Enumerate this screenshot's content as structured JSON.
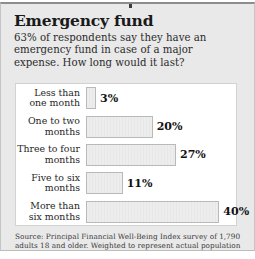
{
  "card": {
    "headline": "Emergency fund",
    "deck": "63% of respondents say they have an emergency fund in case of a major expense. How long would it last?",
    "source": "Source: Principal Financial Well-Being Index survey of 1,790 adults 18 and older. Weighted to represent actual population",
    "accent_color": "#8d8d8d",
    "background_color": "#e9e9e9",
    "panel_color": "#ffffff",
    "bar_fill_color": "#ededed",
    "bar_border_color": "#b9b9b9"
  },
  "chart_data": {
    "type": "bar",
    "orientation": "horizontal",
    "title": "Emergency fund",
    "subtitle": "63% of respondents say they have an emergency fund in case of a major expense. How long would it last?",
    "xlabel": "",
    "ylabel": "",
    "xlim": [
      0,
      45
    ],
    "grid": false,
    "legend": false,
    "value_suffix": "%",
    "categories": [
      "Less than one month",
      "One to two months",
      "Three to four months",
      "Five to six months",
      "More than six months"
    ],
    "values": [
      3,
      20,
      27,
      11,
      40
    ],
    "labels": [
      "3%",
      "20%",
      "27%",
      "11%",
      "40%"
    ],
    "source_note": "Source: Principal Financial Well-Being Index survey of 1,790 adults 18 and older. Weighted to represent actual population",
    "sample_size": "1,790 adults"
  }
}
